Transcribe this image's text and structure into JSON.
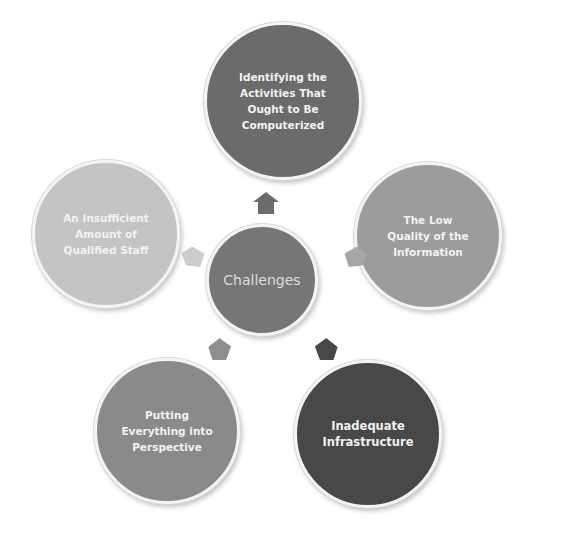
{
  "diagram": {
    "center": {
      "label": "Challenges",
      "color": "#767676"
    },
    "nodes": [
      {
        "id": "top",
        "label": "Identifying the Activities That Ought to Be Computerized",
        "color": "#6b6b6b",
        "arrow_color": "#6b6b6b"
      },
      {
        "id": "right",
        "label": "The Low Quality of the Information",
        "color": "#9c9c9c",
        "arrow_color": "#a6a6a6"
      },
      {
        "id": "bottom-right",
        "label": "Inadequate Infrastructure",
        "color": "#484848",
        "arrow_color": "#484848"
      },
      {
        "id": "bottom-left",
        "label": "Putting Everything into Perspective",
        "color": "#8a8a8a",
        "arrow_color": "#8e8e8e"
      },
      {
        "id": "left",
        "label": "An Insufficient Amount of Qualified Staff",
        "color": "#c4c4c4",
        "arrow_color": "#cccccc"
      }
    ]
  }
}
